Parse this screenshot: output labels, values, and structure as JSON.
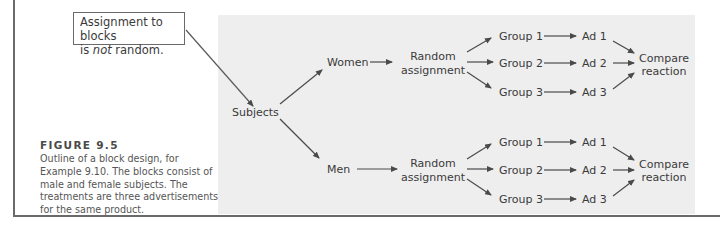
{
  "note": {
    "line1": "Assignment to blocks",
    "line2_prefix": "is ",
    "line2_emphasis": "not",
    "line2_suffix": " random."
  },
  "caption": {
    "title": "FIGURE 9.5",
    "body": "Outline of a block design, for Example 9.10. The blocks consist of male and female subjects. The treatments are three advertisements for the same product."
  },
  "diagram": {
    "root": "Subjects",
    "blocks": [
      {
        "name": "Women",
        "random_line1": "Random",
        "random_line2": "assignment",
        "groups": [
          "Group 1",
          "Group 2",
          "Group 3"
        ],
        "ads": [
          "Ad 1",
          "Ad 2",
          "Ad 3"
        ],
        "compare_line1": "Compare",
        "compare_line2": "reaction"
      },
      {
        "name": "Men",
        "random_line1": "Random",
        "random_line2": "assignment",
        "groups": [
          "Group 1",
          "Group 2",
          "Group 3"
        ],
        "ads": [
          "Ad 1",
          "Ad 2",
          "Ad 3"
        ],
        "compare_line1": "Compare",
        "compare_line2": "reaction"
      }
    ]
  },
  "colors": {
    "panel": "#eeeeee",
    "line": "#4a4a4a",
    "text": "#3a3a3a"
  }
}
